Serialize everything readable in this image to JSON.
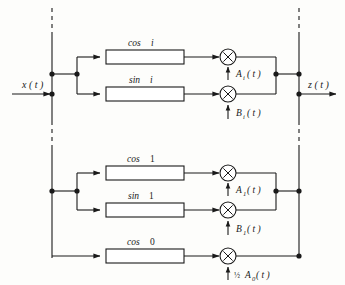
{
  "diagram": {
    "input": {
      "label": "x ( t )",
      "name": "x(t)"
    },
    "output": {
      "label": "z ( t )",
      "name": "z(t)"
    },
    "colors": {
      "line": "#1a1a1a",
      "background": "#fdfdfb",
      "box_fill": "#ffffff",
      "node": "#1a1a1a"
    },
    "branches": [
      {
        "id": "cos-i",
        "filter_label": "cos",
        "order_label": "i",
        "order_italic": true,
        "mult_input_base": "A",
        "mult_input_sub": "i",
        "mult_input_suffix": "( t )",
        "mult_input_prefix": "",
        "mult_symbol": "×"
      },
      {
        "id": "sin-i",
        "filter_label": "sin",
        "order_label": "i",
        "order_italic": true,
        "mult_input_base": "B",
        "mult_input_sub": "i",
        "mult_input_suffix": "( t )",
        "mult_input_prefix": "",
        "mult_symbol": "×"
      },
      {
        "id": "cos-1",
        "filter_label": "cos",
        "order_label": "1",
        "order_italic": false,
        "mult_input_base": "A",
        "mult_input_sub": "1",
        "mult_input_suffix": "( t )",
        "mult_input_prefix": "",
        "mult_symbol": "×"
      },
      {
        "id": "sin-1",
        "filter_label": "sin",
        "order_label": "1",
        "order_italic": false,
        "mult_input_base": "B",
        "mult_input_sub": "1",
        "mult_input_suffix": "( t )",
        "mult_input_prefix": "",
        "mult_symbol": "×"
      },
      {
        "id": "cos-0",
        "filter_label": "cos",
        "order_label": "0",
        "order_italic": false,
        "mult_input_base": "A",
        "mult_input_sub": "0",
        "mult_input_suffix": "( t )",
        "mult_input_prefix": "½",
        "mult_symbol": "×"
      }
    ]
  }
}
